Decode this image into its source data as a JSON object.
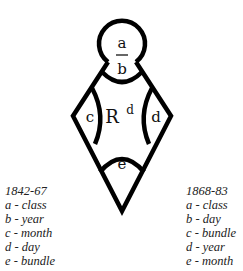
{
  "diagram": {
    "labels": {
      "a": "a",
      "b": "b",
      "c": "c",
      "d": "d",
      "e": "e",
      "center": "R",
      "center_superscript": "d"
    },
    "stroke_color": "#000000"
  },
  "legend_left": {
    "title": "1842-67",
    "items": [
      "a - class",
      "b - year",
      "c - month",
      "d - day",
      "e - bundle"
    ]
  },
  "legend_right": {
    "title": "1868-83",
    "items": [
      "a - class",
      "b - day",
      "c - bundle",
      "d - year",
      "e - month"
    ]
  }
}
